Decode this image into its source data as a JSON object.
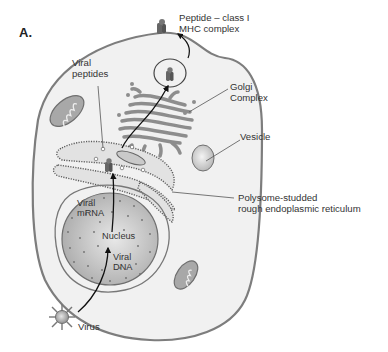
{
  "figure": {
    "panel_label": "A.",
    "labels": {
      "peptide_mhc_line1": "Peptide – class I",
      "peptide_mhc_line2": "MHC complex",
      "viral_peptides_line1": "Viral",
      "viral_peptides_line2": "peptides",
      "golgi_line1": "Golgi",
      "golgi_line2": "Complex",
      "vesicle": "Vesicle",
      "rer_line1": "Polysome-studded",
      "rer_line2": "rough endoplasmic reticulum",
      "viral_mrna_line1": "Viral",
      "viral_mrna_line2": "mRNA",
      "nucleus": "Nucleus",
      "viral_dna_line1": "Viral",
      "viral_dna_line2": "DNA",
      "virus": "Virus"
    },
    "colors": {
      "cell_fill": "#f1f1f1",
      "membrane": "#7a7a7a",
      "organelle": "#9a9a9a",
      "nucleus_fill": "#b8b8b8",
      "text": "#333333"
    }
  }
}
